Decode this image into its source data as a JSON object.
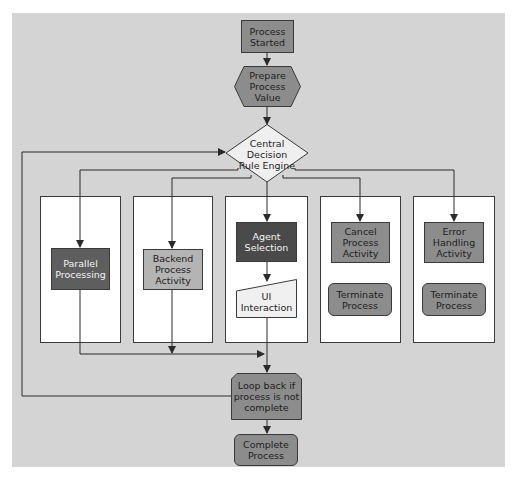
{
  "diagram": {
    "type": "flowchart",
    "colors": {
      "background": "#ffffff",
      "panel": "#d4d4d4",
      "lane": "#ffffff",
      "line": "#2a2a2a",
      "node_medium": "#8c8c8c",
      "node_dark": "#5e5e5e",
      "node_darkest": "#4a4a4a",
      "node_light_gray": "#b4b4b4",
      "node_white": "#f0f0f0",
      "diamond_fill": "#efefef"
    },
    "nodes": {
      "start": {
        "label": "Process Started",
        "shape": "rectangle"
      },
      "prepare": {
        "label": "Prepare Process Value",
        "shape": "hexagon"
      },
      "decision": {
        "label": "Central Decision Rule Engine",
        "shape": "diamond"
      },
      "parallel": {
        "label": "Parallel Processing",
        "shape": "rectangle"
      },
      "backend": {
        "label": "Backend Process Activity",
        "shape": "rectangle"
      },
      "agent": {
        "label": "Agent Selection",
        "shape": "rectangle"
      },
      "ui": {
        "label": "UI Interaction",
        "shape": "manual-input"
      },
      "cancel": {
        "label": "Cancel Process Activity",
        "shape": "rectangle"
      },
      "terminate1": {
        "label": "Terminate Process",
        "shape": "rounded-rectangle"
      },
      "error": {
        "label": "Error Handling Activity",
        "shape": "rectangle"
      },
      "terminate2": {
        "label": "Terminate Process",
        "shape": "rounded-rectangle"
      },
      "loop": {
        "label": "Loop back if process is not complete",
        "shape": "octagon"
      },
      "complete": {
        "label": "Complete Process",
        "shape": "rounded-rectangle"
      }
    },
    "lanes": [
      "parallel",
      "backend",
      "agent",
      "cancel",
      "error"
    ],
    "edges": [
      {
        "from": "start",
        "to": "prepare"
      },
      {
        "from": "prepare",
        "to": "decision"
      },
      {
        "from": "decision",
        "to": "parallel"
      },
      {
        "from": "decision",
        "to": "backend"
      },
      {
        "from": "decision",
        "to": "agent"
      },
      {
        "from": "decision",
        "to": "cancel"
      },
      {
        "from": "decision",
        "to": "error"
      },
      {
        "from": "agent",
        "to": "ui"
      },
      {
        "from": "parallel",
        "to": "loop"
      },
      {
        "from": "backend",
        "to": "loop"
      },
      {
        "from": "ui",
        "to": "loop"
      },
      {
        "from": "loop",
        "to": "decision",
        "label": "loop back"
      },
      {
        "from": "loop",
        "to": "complete"
      }
    ]
  }
}
